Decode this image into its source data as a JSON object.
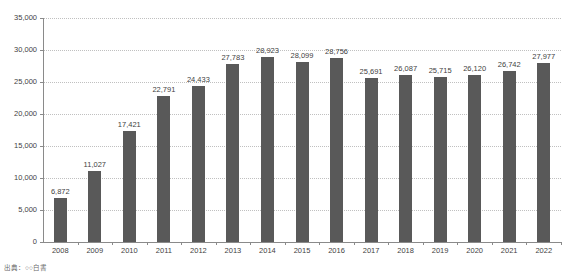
{
  "chart_data": {
    "type": "bar",
    "title": "",
    "subtitle": "",
    "xlabel": "",
    "ylabel": "",
    "categories": [
      "2008",
      "2009",
      "2010",
      "2011",
      "2012",
      "2013",
      "2014",
      "2015",
      "2016",
      "2017",
      "2018",
      "2019",
      "2020",
      "2021",
      "2022"
    ],
    "values": [
      6872,
      11027,
      17421,
      22791,
      24433,
      27783,
      28923,
      28099,
      28756,
      25691,
      26087,
      25715,
      26120,
      26742,
      27977
    ],
    "value_labels": [
      "6,872",
      "11,027",
      "17,421",
      "22,791",
      "24,433",
      "27,783",
      "28,923",
      "28,099",
      "28,756",
      "25,691",
      "26,087",
      "25,715",
      "26,120",
      "26,742",
      "27,977"
    ],
    "ylim": [
      0,
      35000
    ],
    "y_tick_values": [
      0,
      5000,
      10000,
      15000,
      20000,
      25000,
      30000,
      35000
    ],
    "y_tick_labels": [
      "0",
      "5,000",
      "10,000",
      "15,000",
      "20,000",
      "25,000",
      "30,000",
      "35,000"
    ],
    "grid": true,
    "grid_style": "dotted",
    "legend": false,
    "legend_position": "none",
    "series": [
      {
        "name": "",
        "values": [
          6872,
          11027,
          17421,
          22791,
          24433,
          27783,
          28923,
          28099,
          28756,
          25691,
          26087,
          25715,
          26120,
          26742,
          27977
        ]
      }
    ]
  },
  "style": {
    "bar_color": "#595959",
    "grid_color": "#c0c0c0",
    "axis_color": "#8a8a8a",
    "text_color": "#3f3f3f",
    "background": "#ffffff"
  },
  "footnote": {
    "text": "出典：○○白書"
  }
}
